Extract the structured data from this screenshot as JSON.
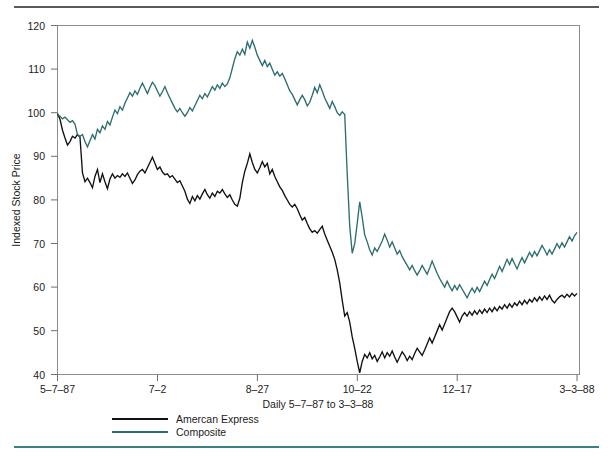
{
  "figure": {
    "rule_color_top": "#5a5a5a",
    "rule_color_bottom": "#3c7f7f"
  },
  "chart_data": {
    "type": "line",
    "title": "",
    "xlabel": "Daily 5–7–87 to 3–3–88",
    "ylabel": "Indexed Stock Price",
    "ylim": [
      40,
      120
    ],
    "yticks": [
      40,
      50,
      60,
      70,
      80,
      90,
      100,
      110,
      120
    ],
    "ytick_labels": [
      "40",
      "50",
      "60",
      "70",
      "80",
      "90",
      "100",
      "110",
      "120"
    ],
    "xlim": [
      0,
      209
    ],
    "xticks": [
      0,
      40,
      80,
      120,
      160,
      208
    ],
    "xtick_labels": [
      "5–7–87",
      "7–2",
      "8–27",
      "10–22",
      "12–17",
      "3–3–88"
    ],
    "grid": false,
    "legend_position": "below-axes-left",
    "colors": {
      "american_express": "#111111",
      "composite": "#2d6e6e"
    },
    "series": [
      {
        "name": "Amercan Express",
        "color": "#111111",
        "values": [
          99.8,
          98.5,
          96.0,
          94.2,
          92.6,
          93.4,
          94.6,
          94.2,
          95.0,
          94.4,
          86.2,
          84.2,
          85.0,
          84.0,
          82.8,
          85.4,
          87.0,
          84.0,
          86.0,
          84.2,
          82.6,
          84.8,
          86.0,
          85.0,
          85.6,
          85.2,
          86.0,
          85.4,
          86.2,
          85.0,
          83.8,
          84.6,
          85.8,
          86.6,
          87.0,
          86.2,
          87.4,
          88.6,
          89.8,
          88.4,
          87.0,
          87.6,
          86.4,
          85.8,
          86.0,
          85.2,
          85.6,
          84.8,
          84.0,
          84.4,
          83.2,
          82.0,
          80.2,
          79.2,
          80.8,
          79.8,
          81.0,
          80.2,
          81.4,
          82.4,
          81.2,
          80.4,
          81.6,
          80.8,
          82.0,
          81.6,
          82.4,
          81.4,
          80.6,
          81.2,
          80.0,
          79.0,
          78.6,
          80.4,
          84.0,
          86.6,
          88.4,
          90.6,
          88.6,
          87.0,
          86.2,
          87.4,
          88.8,
          87.6,
          88.4,
          86.0,
          87.0,
          85.4,
          84.2,
          83.0,
          82.2,
          81.0,
          80.0,
          79.0,
          78.4,
          79.0,
          78.0,
          76.6,
          75.4,
          76.0,
          74.6,
          73.4,
          72.6,
          73.0,
          72.4,
          73.2,
          74.0,
          72.2,
          70.8,
          69.4,
          68.0,
          66.4,
          64.0,
          61.0,
          57.0,
          53.4,
          54.2,
          52.0,
          48.6,
          46.0,
          43.0,
          40.4,
          43.0,
          44.6,
          43.8,
          45.0,
          43.6,
          44.4,
          43.0,
          44.0,
          45.2,
          43.8,
          45.0,
          44.2,
          45.4,
          44.0,
          42.8,
          44.0,
          45.2,
          44.4,
          43.2,
          44.2,
          43.4,
          44.8,
          46.0,
          45.2,
          44.4,
          45.6,
          47.0,
          48.4,
          47.2,
          48.6,
          50.0,
          51.4,
          50.2,
          51.6,
          53.0,
          54.4,
          55.2,
          54.4,
          53.2,
          52.0,
          53.4,
          54.2,
          53.4,
          54.4,
          53.6,
          54.6,
          53.8,
          54.8,
          54.0,
          55.0,
          54.2,
          55.2,
          54.4,
          55.4,
          54.6,
          55.6,
          55.0,
          56.0,
          55.2,
          56.2,
          55.4,
          56.4,
          55.8,
          56.8,
          56.0,
          57.0,
          56.2,
          57.2,
          56.6,
          57.6,
          56.8,
          57.8,
          57.0,
          58.0,
          57.2,
          58.2,
          57.0,
          56.4,
          57.2,
          57.8,
          58.2,
          57.6,
          58.4,
          57.8,
          58.6,
          58.0,
          58.6
        ]
      },
      {
        "name": "Composite",
        "color": "#2d6e6e",
        "values": [
          99.6,
          99.2,
          98.6,
          99.0,
          98.4,
          97.8,
          98.2,
          97.4,
          95.0,
          94.6,
          95.0,
          93.4,
          92.2,
          93.6,
          95.0,
          94.0,
          96.2,
          95.4,
          97.0,
          96.2,
          98.0,
          97.2,
          99.0,
          100.6,
          99.8,
          101.4,
          100.6,
          102.2,
          103.4,
          104.6,
          103.8,
          105.0,
          104.2,
          105.6,
          106.8,
          105.6,
          104.4,
          105.8,
          107.0,
          106.2,
          105.0,
          103.8,
          104.8,
          106.0,
          104.6,
          103.4,
          102.2,
          101.0,
          100.2,
          101.0,
          100.0,
          99.2,
          100.0,
          101.2,
          100.4,
          101.6,
          102.8,
          104.0,
          103.2,
          104.4,
          103.6,
          104.8,
          106.0,
          105.2,
          106.4,
          105.6,
          106.8,
          106.0,
          106.6,
          108.0,
          110.2,
          112.4,
          114.0,
          113.2,
          114.6,
          113.4,
          116.2,
          114.8,
          116.6,
          115.0,
          113.2,
          112.0,
          110.8,
          112.0,
          110.6,
          111.4,
          110.0,
          108.6,
          109.4,
          108.4,
          109.0,
          107.8,
          106.4,
          105.0,
          104.2,
          103.0,
          101.8,
          103.0,
          104.0,
          103.0,
          101.6,
          102.4,
          104.0,
          105.8,
          104.6,
          106.4,
          105.0,
          103.4,
          102.2,
          101.0,
          102.6,
          101.4,
          100.0,
          99.4,
          100.2,
          99.6,
          86.0,
          74.0,
          67.8,
          70.0,
          74.6,
          79.6,
          76.0,
          72.0,
          70.4,
          68.6,
          67.4,
          69.0,
          68.2,
          69.4,
          70.6,
          72.2,
          70.8,
          69.2,
          70.4,
          69.0,
          67.6,
          68.4,
          67.0,
          66.0,
          65.0,
          64.0,
          65.0,
          63.8,
          62.8,
          63.8,
          65.0,
          64.0,
          63.0,
          64.4,
          66.0,
          64.6,
          63.2,
          62.0,
          61.0,
          60.0,
          61.4,
          60.2,
          59.2,
          60.4,
          59.4,
          60.6,
          59.6,
          58.6,
          57.6,
          58.8,
          59.8,
          58.8,
          60.0,
          59.0,
          60.2,
          61.4,
          60.4,
          61.8,
          63.0,
          62.0,
          63.4,
          64.8,
          63.6,
          65.0,
          66.4,
          65.2,
          66.6,
          65.4,
          64.2,
          65.6,
          66.8,
          65.6,
          66.8,
          68.0,
          67.0,
          68.2,
          67.2,
          68.4,
          69.6,
          68.6,
          67.4,
          68.6,
          67.6,
          68.8,
          70.0,
          69.0,
          70.2,
          69.2,
          70.4,
          71.6,
          70.6,
          71.8,
          72.6
        ]
      }
    ]
  },
  "legend": [
    {
      "label": "Amercan Express",
      "color": "#111111"
    },
    {
      "label": "Composite",
      "color": "#2d6e6e"
    }
  ]
}
